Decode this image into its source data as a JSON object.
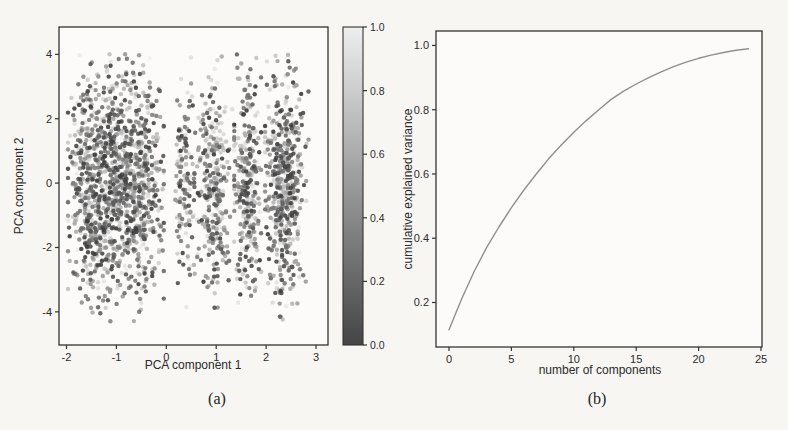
{
  "page": {
    "background": "#f7f6f3",
    "axis_color": "#333333",
    "text_color": "#2b2b2b"
  },
  "captions": {
    "a": "(a)",
    "b": "(b)"
  },
  "chart_data": [
    {
      "id": "pca-scatter",
      "type": "scatter",
      "title": "",
      "xlabel": "PCA component 1",
      "ylabel": "PCA component 2",
      "xlim": [
        -2.15,
        3.24
      ],
      "ylim": [
        -5.03,
        4.85
      ],
      "xticks": [
        "-2",
        "-1",
        "0",
        "1",
        "2",
        "3"
      ],
      "yticks": [
        "-4",
        "-2",
        "0",
        "2",
        "4"
      ],
      "grid": false,
      "marker_shape": "circle",
      "marker_radius_px": 2.2,
      "marker_color_dark": "#3c3c3c",
      "marker_color_light": "#f0f0f0",
      "colorbar": {
        "min": 0.0,
        "max": 1.0,
        "ticks": [
          "0.0",
          "0.2",
          "0.4",
          "0.6",
          "0.8",
          "1.0"
        ],
        "gradient_bottom": "#454545",
        "gradient_top": "#eeeeee",
        "orientation": "vertical",
        "position": "right"
      },
      "clusters": [
        {
          "cx": -1.02,
          "x_uniform": 0.75,
          "x_tri": 0.28,
          "x_min": -1.97,
          "x_max": -0.05,
          "count": 1250
        },
        {
          "cx": 0.38,
          "x_uniform": 0.05,
          "x_tri": 0.17,
          "x_min": 0.16,
          "x_max": 0.62,
          "count": 130
        },
        {
          "cx": 0.96,
          "x_uniform": 0.1,
          "x_tri": 0.22,
          "x_min": 0.62,
          "x_max": 1.32,
          "count": 290
        },
        {
          "cx": 1.62,
          "x_uniform": 0.07,
          "x_tri": 0.2,
          "x_min": 1.36,
          "x_max": 1.9,
          "count": 290
        },
        {
          "cx": 2.37,
          "x_uniform": 0.16,
          "x_tri": 0.26,
          "x_min": 1.98,
          "x_max": 2.85,
          "count": 480
        }
      ],
      "y_sigma": 1.75,
      "y_min": -4.35,
      "y_max": 4.05
    },
    {
      "id": "cumulative-variance",
      "type": "line",
      "title": "",
      "xlabel": "number of components",
      "ylabel": "cumulative explained variance",
      "xlim": [
        -1.04,
        25.08
      ],
      "ylim": [
        0.0615,
        1.045
      ],
      "xticks": [
        "0",
        "5",
        "10",
        "15",
        "20",
        "25"
      ],
      "yticks": [
        "0.2",
        "0.4",
        "0.6",
        "0.8",
        "1.0"
      ],
      "grid": false,
      "legend": "none",
      "line_color": "#8f8f8f",
      "line_width": 1.4,
      "x": [
        0,
        1,
        2,
        3,
        4,
        5,
        6,
        7,
        8,
        9,
        10,
        11,
        12,
        13,
        14,
        15,
        16,
        17,
        18,
        19,
        20,
        21,
        22,
        23,
        24
      ],
      "y": [
        0.115,
        0.21,
        0.295,
        0.37,
        0.435,
        0.495,
        0.55,
        0.6,
        0.648,
        0.69,
        0.73,
        0.766,
        0.8,
        0.832,
        0.858,
        0.88,
        0.9,
        0.918,
        0.934,
        0.948,
        0.96,
        0.97,
        0.978,
        0.985,
        0.99
      ]
    }
  ]
}
